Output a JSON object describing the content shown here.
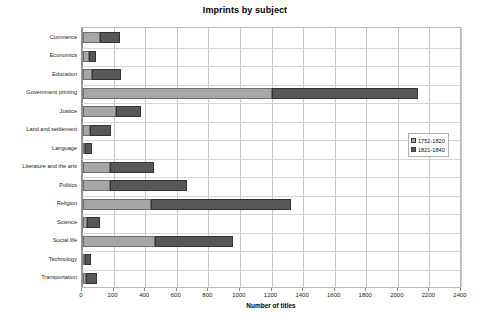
{
  "chart_data": {
    "type": "bar",
    "orientation": "horizontal",
    "stacked": true,
    "title": "Imprints by subject",
    "xlabel": "Number of titles",
    "ylabel": "",
    "xlim": [
      0,
      2400
    ],
    "xticks": [
      0,
      200,
      400,
      600,
      800,
      1000,
      1200,
      1400,
      1600,
      1800,
      2000,
      2200,
      2400
    ],
    "grid": true,
    "legend_position": "right-middle",
    "categories": [
      "Commerce",
      "Economics",
      "Education",
      "Government printing",
      "Justice",
      "Land and settlement",
      "Language",
      "Literature and the arts",
      "Politics",
      "Religion",
      "Science",
      "Social life",
      "Technology",
      "Transportation"
    ],
    "series": [
      {
        "name": "1752-1820",
        "color": "#a6a6a6",
        "values": [
          110,
          38,
          57,
          1195,
          208,
          44,
          10,
          170,
          170,
          430,
          25,
          455,
          12,
          20
        ]
      },
      {
        "name": "1821-1840",
        "color": "#585858",
        "values": [
          125,
          44,
          183,
          927,
          158,
          133,
          47,
          280,
          490,
          890,
          82,
          495,
          38,
          68
        ]
      }
    ],
    "totals": [
      235,
      82,
      240,
      2122,
      366,
      177,
      57,
      450,
      660,
      1320,
      107,
      950,
      50,
      88
    ]
  }
}
